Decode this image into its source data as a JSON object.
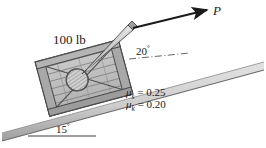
{
  "figure": {
    "labels": {
      "weight": "100 lb",
      "force": "P",
      "force_angle": "20",
      "incline_angle": "15",
      "degree_symbol": "°",
      "mu_symbol": "μ",
      "mu_static_sub": "s",
      "mu_kinetic_sub": "k",
      "mu_static_eq": "= 0.25",
      "mu_kinetic_eq": "= 0.20",
      "mu_static_value": "0.25",
      "mu_kinetic_value": "0.20"
    },
    "colors": {
      "incline_fill": "#c9c9c9",
      "incline_edge": "#6e6e6e",
      "crate_fill": "#b9b9b9",
      "crate_frame": "#a0a0a0",
      "crate_outline": "#4a4a4a",
      "handle_fill": "#bdbdbd",
      "arrow": "#1b1b1b",
      "text": "#1b1b1b",
      "reference_line": "#555555",
      "background": "#ffffff"
    },
    "geometry": {
      "incline_angle_deg": 15,
      "force_angle_deg": 20,
      "crate_rotation_deg": -15
    }
  }
}
